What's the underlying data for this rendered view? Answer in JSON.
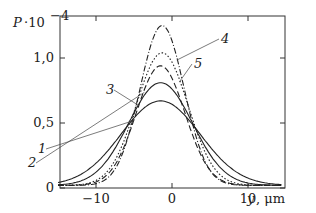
{
  "chart_data": {
    "type": "line",
    "title": "",
    "ylabel": "P·10⁻⁴",
    "ylabel_parts": {
      "base": "P",
      "mult": "·10",
      "exp": "−4"
    },
    "xlabel": "y, μm",
    "xlabel_parts": {
      "var": "y",
      "unit": ", μm"
    },
    "xlim": [
      -15,
      14.5
    ],
    "ylim": [
      0,
      1.35
    ],
    "xticks": [
      -10,
      0,
      10
    ],
    "xtick_labels": [
      "−10",
      "0",
      "10"
    ],
    "yticks": [
      0,
      0.5,
      1.0
    ],
    "ytick_labels": [
      "0",
      "0,5",
      "1,0"
    ],
    "grid": false,
    "legend": "inline numbered callouts",
    "series": [
      {
        "name": "1",
        "style": "solid",
        "peak_x": -1.5,
        "peak_y": 0.65,
        "sigma": 5.2
      },
      {
        "name": "2",
        "style": "dashed-dot",
        "peak_x": -1.5,
        "peak_y": 0.92,
        "sigma": 3.2
      },
      {
        "name": "3",
        "style": "solid",
        "peak_x": -1.5,
        "peak_y": 0.79,
        "sigma": 4.2
      },
      {
        "name": "4",
        "style": "dash-dot",
        "peak_x": -1.3,
        "peak_y": 1.23,
        "sigma": 2.9
      },
      {
        "name": "5",
        "style": "dotted",
        "peak_x": -1.3,
        "peak_y": 1.02,
        "sigma": 3.4
      }
    ],
    "callouts": [
      {
        "label": "1",
        "text_x": 38,
        "text_y": 153
      },
      {
        "label": "2",
        "text_x": 28,
        "text_y": 167
      },
      {
        "label": "3",
        "text_x": 106,
        "text_y": 94
      },
      {
        "label": "4",
        "text_x": 221,
        "text_y": 43
      },
      {
        "label": "5",
        "text_x": 194,
        "text_y": 68
      }
    ]
  }
}
